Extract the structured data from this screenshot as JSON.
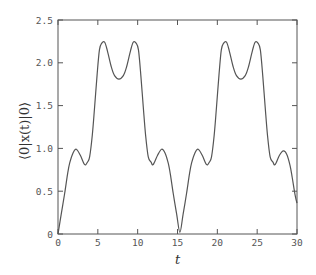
{
  "chart_data": {
    "type": "line",
    "title": "",
    "xlabel": "t",
    "ylabel": "⟨0|x(t)|0⟩",
    "xlim": [
      0,
      30
    ],
    "ylim": [
      0,
      2.5
    ],
    "xticks": [
      0,
      5,
      10,
      15,
      20,
      25,
      30
    ],
    "xtick_labels": [
      "0",
      "5",
      "10",
      "15",
      "20",
      "25",
      "30"
    ],
    "yticks": [
      0,
      0.5,
      1.0,
      1.5,
      2.0,
      2.5
    ],
    "ytick_labels": [
      "0",
      "0.5",
      "1.0",
      "1.5",
      "2.0",
      "2.5"
    ],
    "grid": false,
    "legend": null,
    "line_color": "#555555",
    "series": [
      {
        "name": "⟨0|x(t)|0⟩",
        "x": [
          0,
          0.4,
          0.83,
          1.2,
          1.47,
          1.9,
          2.3,
          2.8,
          3.35,
          3.7,
          3.97,
          4.3,
          4.6,
          4.9,
          5.2,
          5.5,
          5.86,
          6.2,
          6.7,
          7.1,
          7.65,
          8.2,
          8.6,
          9.1,
          9.44,
          9.8,
          10.1,
          10.4,
          10.7,
          11.0,
          11.33,
          11.68,
          11.95,
          12.5,
          13.0,
          13.42,
          13.83,
          14.1,
          14.47,
          14.9,
          15.3,
          15.7,
          16.13,
          16.5,
          16.77,
          17.2,
          17.6,
          18.1,
          18.65,
          19.0,
          19.27,
          19.6,
          19.9,
          20.2,
          20.5,
          20.8,
          21.16,
          21.5,
          22.0,
          22.4,
          22.95,
          23.5,
          23.9,
          24.4,
          24.74,
          25.1,
          25.4,
          25.7,
          26.0,
          26.3,
          26.63,
          26.98,
          27.25,
          27.8,
          28.3,
          28.72,
          29.13,
          29.4,
          29.77,
          30.0
        ],
        "y": [
          0.0,
          0.23,
          0.47,
          0.7,
          0.83,
          0.95,
          0.99,
          0.92,
          0.81,
          0.84,
          0.9,
          1.15,
          1.49,
          1.85,
          2.15,
          2.23,
          2.24,
          2.14,
          1.95,
          1.85,
          1.81,
          1.85,
          1.95,
          2.14,
          2.24,
          2.23,
          2.15,
          1.85,
          1.49,
          1.15,
          0.9,
          0.84,
          0.81,
          0.92,
          0.99,
          0.95,
          0.83,
          0.7,
          0.47,
          0.23,
          0.02,
          0.23,
          0.47,
          0.7,
          0.83,
          0.95,
          0.99,
          0.92,
          0.81,
          0.84,
          0.9,
          1.15,
          1.49,
          1.85,
          2.15,
          2.23,
          2.24,
          2.14,
          1.95,
          1.85,
          1.81,
          1.85,
          1.95,
          2.14,
          2.24,
          2.23,
          2.15,
          1.85,
          1.49,
          1.15,
          0.9,
          0.84,
          0.81,
          0.92,
          0.97,
          0.93,
          0.8,
          0.66,
          0.45,
          0.36
        ]
      }
    ]
  }
}
